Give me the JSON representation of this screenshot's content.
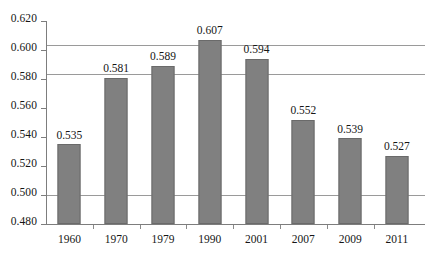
{
  "chart_data": {
    "type": "bar",
    "title": "",
    "subtitle": "",
    "xlabel": "",
    "ylabel": "",
    "categories": [
      "1960",
      "1970",
      "1979",
      "1990",
      "2001",
      "2007",
      "2009",
      "2011"
    ],
    "values": [
      0.535,
      0.581,
      0.589,
      0.607,
      0.594,
      0.552,
      0.539,
      0.527
    ],
    "value_labels": [
      "0.535",
      "0.581",
      "0.589",
      "0.607",
      "0.594",
      "0.552",
      "0.539",
      "0.527"
    ],
    "ylim": [
      0.48,
      0.62
    ],
    "ytick_labels": [
      "0.620",
      "0.600",
      "0.580",
      "0.560",
      "0.540",
      "0.520",
      "0.500",
      "0.480"
    ],
    "ytick_values": [
      0.62,
      0.6,
      0.58,
      0.56,
      0.54,
      0.52,
      0.5,
      0.48
    ],
    "gridlines_at": [
      0.6,
      0.58,
      0.5
    ],
    "grid": true,
    "legend": "none",
    "bar_color": "#808080",
    "bar_edge_color": "#6a6a6a",
    "axis_color": "#7d7d7d",
    "gridline_color": "#9a9a9a",
    "text_color": "#161616",
    "background_color": "#ffffff"
  }
}
